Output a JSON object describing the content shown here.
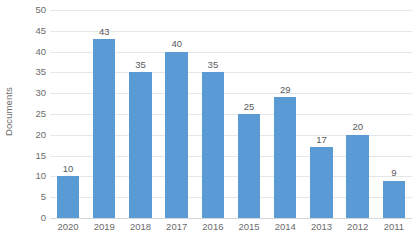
{
  "chart_data": {
    "type": "bar",
    "title": "",
    "xlabel": "",
    "ylabel": "Documents",
    "categories": [
      "2020",
      "2019",
      "2018",
      "2017",
      "2016",
      "2015",
      "2014",
      "2013",
      "2012",
      "2011"
    ],
    "values": [
      10,
      43,
      35,
      40,
      35,
      25,
      29,
      17,
      20,
      9
    ],
    "data_labels": [
      "10",
      "43",
      "35",
      "40",
      "35",
      "25",
      "29",
      "17",
      "20",
      "9"
    ],
    "ylim": [
      0,
      50
    ],
    "y_ticks": [
      0,
      5,
      10,
      15,
      20,
      25,
      30,
      35,
      40,
      45,
      50
    ],
    "y_tick_labels": [
      "0",
      "5",
      "10",
      "15",
      "20",
      "25",
      "30",
      "35",
      "40",
      "45",
      "50"
    ],
    "grid": true,
    "grid_axis": "y",
    "legend": false,
    "legend_position": "none",
    "series": [
      {
        "name": "Documents",
        "values": [
          10,
          43,
          35,
          40,
          35,
          25,
          29,
          17,
          20,
          9
        ],
        "color": "#5b9bd5"
      }
    ]
  },
  "colors": {
    "bar": "#5b9bd5",
    "gridline": "#e3e7ea",
    "axis_line": "#d2d7db",
    "tick_text": "#6b6b6b",
    "label_text": "#5a5a5a",
    "background": "#ffffff"
  },
  "axis": {
    "y_title": "Documents"
  }
}
